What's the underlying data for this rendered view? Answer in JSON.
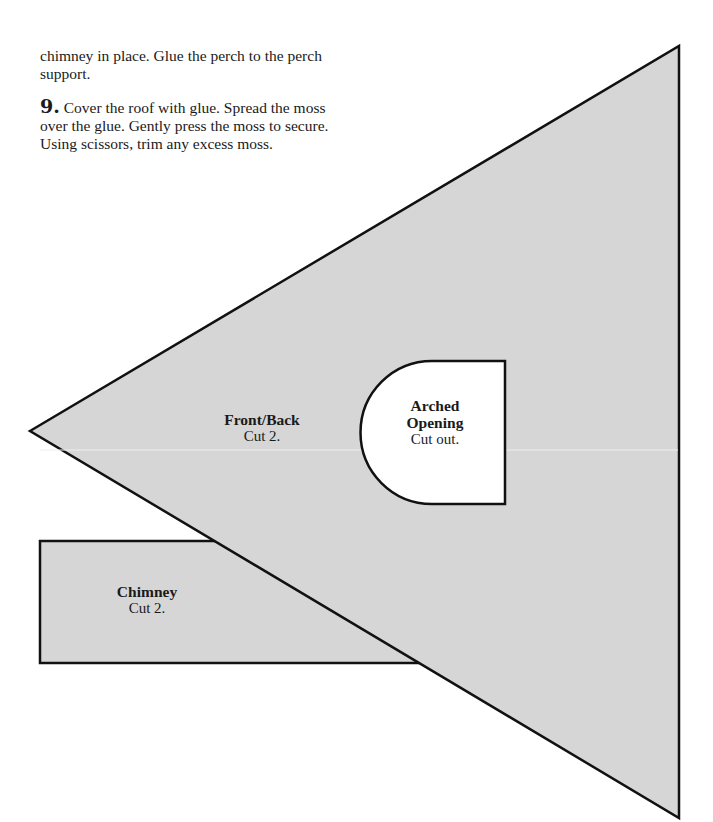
{
  "instructions": {
    "continued_paragraph": "chimney in place. Glue the perch to the perch support.",
    "step9": {
      "number": "9.",
      "text": "Cover the roof with glue. Spread the moss over the glue. Gently press the moss to secure. Using scissors, trim any excess moss."
    }
  },
  "pattern": {
    "fill_color": "#d6d6d6",
    "outline_color": "#111111",
    "front_back": {
      "title": "Front/Back",
      "instruction": "Cut 2."
    },
    "arched_opening": {
      "title_line1": "Arched",
      "title_line2": "Opening",
      "instruction": "Cut out."
    },
    "chimney": {
      "title": "Chimney",
      "instruction": "Cut 2."
    }
  }
}
